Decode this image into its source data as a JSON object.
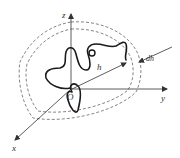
{
  "diagram": {
    "type": "3d-coordinate-surface-shells",
    "axes": {
      "x": {
        "label": "x"
      },
      "y": {
        "label": "y"
      },
      "z": {
        "label": "z"
      }
    },
    "origin_label": "O",
    "radius_label": "h",
    "thickness_label": "dh",
    "colors": {
      "line": "#333333",
      "curve": "#1a1a1a",
      "dashed": "#666666",
      "background": "#ffffff"
    }
  }
}
